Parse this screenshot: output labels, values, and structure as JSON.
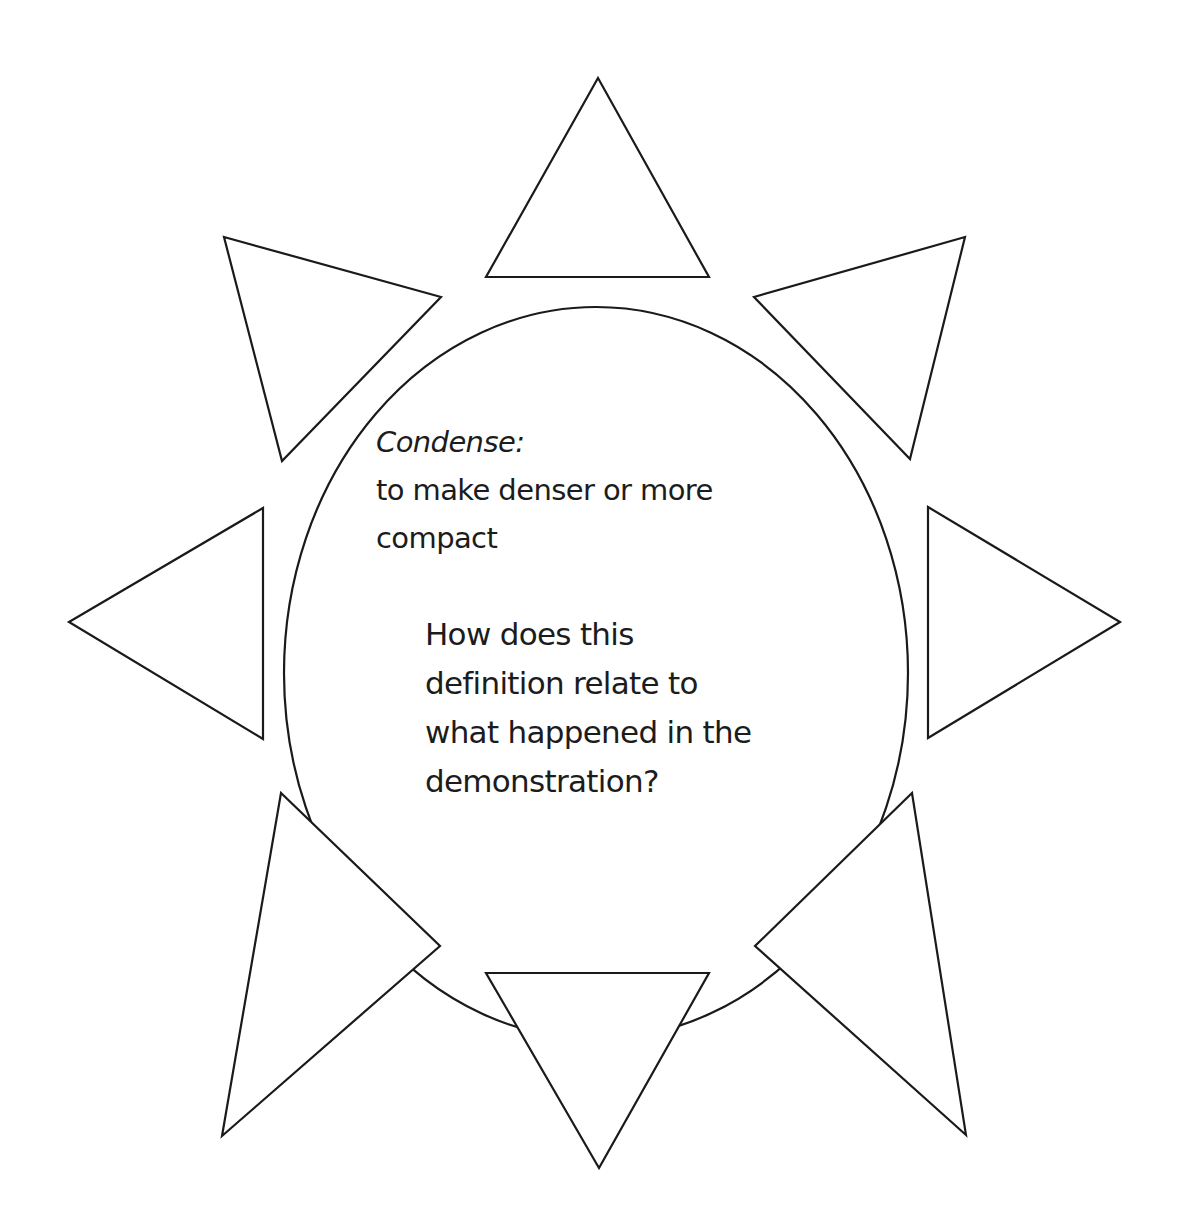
{
  "diagram": {
    "type": "sun-graphic-organizer",
    "center": {
      "term": "Condense:",
      "definition_lines": [
        "to make denser or more",
        "compact"
      ],
      "question_lines": [
        "How does this",
        "definition relate to",
        "what happened in the",
        "demonstration?"
      ]
    },
    "rays": [
      {
        "position": "top",
        "points": "598,78 709,277 486,277"
      },
      {
        "position": "top-right",
        "points": "965,237 910,459 754,297"
      },
      {
        "position": "right",
        "points": "1120,622 928,738 928,507"
      },
      {
        "position": "bottom-right",
        "points": "966,1135 755,946 912,793"
      },
      {
        "position": "bottom",
        "points": "599,1168 486,973 709,973"
      },
      {
        "position": "bottom-left",
        "points": "222,1136 281,793 440,946"
      },
      {
        "position": "left",
        "points": "69,622 263,508 263,739"
      },
      {
        "position": "top-left",
        "points": "224,237 441,297 282,461"
      }
    ],
    "ellipse": {
      "cx": 596,
      "cy": 673,
      "rx": 312,
      "ry": 366
    },
    "colors": {
      "stroke": "#1a1a1a",
      "fill": "#ffffff",
      "text": "#1c1c1c",
      "background": "#ffffff"
    }
  }
}
